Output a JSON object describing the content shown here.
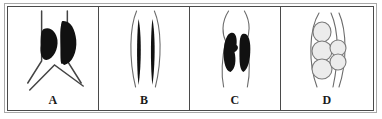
{
  "figure": {
    "panel_count": 4,
    "background_color": "#ffffff",
    "outer_border_color": "#a9a9a9",
    "inner_border_color": "#4a4a4a",
    "divider_color": "#4a4a4a",
    "ink_color": "#111111",
    "line_color": "#6b6b6b",
    "vesicle_fill_color": "#ececec",
    "vesicle_stroke_color": "#7a7a7a",
    "panels": [
      {
        "label": "A",
        "motif": "branching-vertical-lines-with-two-dark-masses",
        "description": "Two near-vertical lines splaying outward at the base over an inverted-V chevron, with two solid dark masses between the upper line segments",
        "dark_mass_count": 2,
        "vesicle_count": 0
      },
      {
        "label": "B",
        "motif": "paired-thin-spindles",
        "description": "Two slender spindle shaped dark bands tapering at both ends, flanked by faint outward bowing curves",
        "dark_mass_count": 2,
        "vesicle_count": 0
      },
      {
        "label": "C",
        "motif": "paired-thick-irregular-masses",
        "description": "Two thick irregular dark masses centred between thin curved lines that extend above and below",
        "dark_mass_count": 2,
        "vesicle_count": 0
      },
      {
        "label": "D",
        "motif": "stacked-pale-vesicles",
        "description": "Five pale grey ellipses, three stacked on the left and two on the right, between bowing curved lines",
        "dark_mass_count": 0,
        "vesicle_count": 5
      }
    ]
  }
}
